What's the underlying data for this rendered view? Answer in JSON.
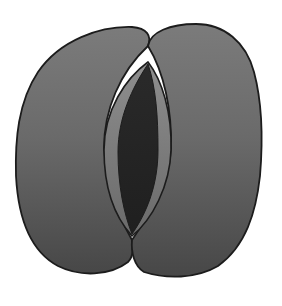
{
  "diagram": {
    "parts": [
      {
        "id": "left-guard-cell",
        "label": "left guard cell"
      },
      {
        "id": "right-guard-cell",
        "label": "right guard cell"
      },
      {
        "id": "inner-wall",
        "label": "thickened inner wall"
      },
      {
        "id": "pore",
        "label": "stomatal pore"
      }
    ],
    "colors": {
      "background": "#ffffff",
      "cell_top": "#7b7b7b",
      "cell_bottom": "#474747",
      "inner_wall_top": "#8e8e8e",
      "inner_wall_bottom": "#6a6a6a",
      "pore": "#242424",
      "outline": "#1c1c1c"
    }
  }
}
